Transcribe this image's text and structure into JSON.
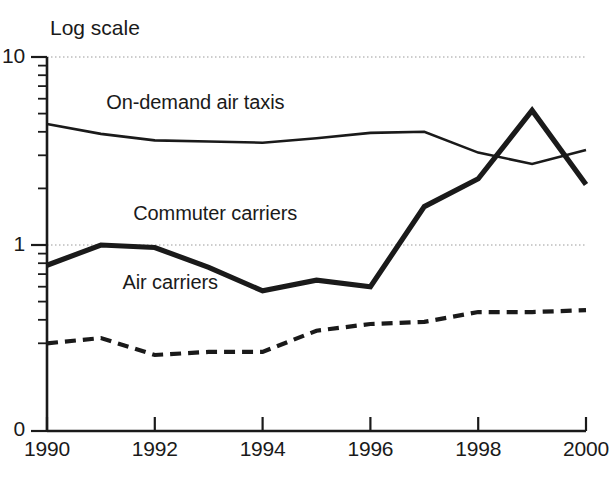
{
  "chart_data": {
    "type": "line",
    "title": "",
    "subtitle": "",
    "scale_note": "Log scale",
    "xlabel": "",
    "ylabel": "",
    "yscale": "log",
    "ylim": [
      0.2,
      10
    ],
    "xlim": [
      1990,
      2000
    ],
    "grid": "horizontal-dotted-at-major-yticks",
    "legend": "inline-annotations",
    "x": [
      1990,
      1991,
      1992,
      1993,
      1994,
      1995,
      1996,
      1997,
      1998,
      1999,
      2000
    ],
    "y_major_ticks": [
      1,
      10
    ],
    "y_major_tick_labels": [
      "1",
      "10"
    ],
    "y_axis_origin_label": "0",
    "y_minor_ticks": [
      0.3,
      0.4,
      0.5,
      0.6,
      0.7,
      0.8,
      0.9,
      2,
      3,
      4,
      5,
      6,
      7,
      8,
      9
    ],
    "x_ticks": [
      1990,
      1992,
      1994,
      1996,
      1998,
      2000
    ],
    "x_tick_labels": [
      "1990",
      "1992",
      "1994",
      "1996",
      "1998",
      "2000"
    ],
    "series": [
      {
        "name": "On-demand air taxis",
        "style": "solid-thin",
        "color": "#1a1a1a",
        "label_x": 1991.1,
        "label_y": 5.6,
        "values": [
          4.4,
          3.9,
          3.6,
          3.55,
          3.5,
          3.7,
          3.95,
          4.0,
          3.1,
          2.7,
          3.2
        ]
      },
      {
        "name": "Commuter carriers",
        "style": "solid-thick",
        "color": "#1a1a1a",
        "label_x": 1991.6,
        "label_y": 1.45,
        "values": [
          0.78,
          1.0,
          0.97,
          0.76,
          0.57,
          0.65,
          0.6,
          1.6,
          2.25,
          5.2,
          2.1
        ]
      },
      {
        "name": "Air carriers",
        "style": "dashed",
        "color": "#1a1a1a",
        "label_x": 1991.4,
        "label_y": 0.62,
        "values": [
          0.3,
          0.32,
          0.26,
          0.27,
          0.27,
          0.35,
          0.38,
          0.39,
          0.44,
          0.44,
          0.45
        ]
      }
    ]
  }
}
